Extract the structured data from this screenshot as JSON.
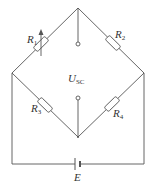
{
  "diagram": {
    "stroke_color": "#555555",
    "labels": {
      "r1": {
        "main": "R",
        "sub": "1"
      },
      "r2": {
        "main": "R",
        "sub": "2"
      },
      "r3": {
        "main": "R",
        "sub": "3"
      },
      "r4": {
        "main": "R",
        "sub": "4"
      },
      "output": {
        "main": "U",
        "sub": "SC"
      },
      "source": {
        "main": "E",
        "sub": ""
      }
    },
    "nodes": {
      "top": [
        78,
        8
      ],
      "left": [
        12,
        73
      ],
      "right": [
        144,
        73
      ],
      "bottom": [
        78,
        137
      ],
      "terminal_upper": [
        78,
        44
      ],
      "terminal_lower": [
        78,
        98
      ]
    },
    "components": [
      {
        "id": "R1",
        "type": "variable-resistor",
        "branch": "top-left"
      },
      {
        "id": "R2",
        "type": "resistor",
        "branch": "top-right"
      },
      {
        "id": "R3",
        "type": "resistor",
        "branch": "left-bottom"
      },
      {
        "id": "R4",
        "type": "resistor",
        "branch": "right-bottom"
      },
      {
        "id": "E",
        "type": "battery",
        "branch": "supply"
      }
    ]
  }
}
